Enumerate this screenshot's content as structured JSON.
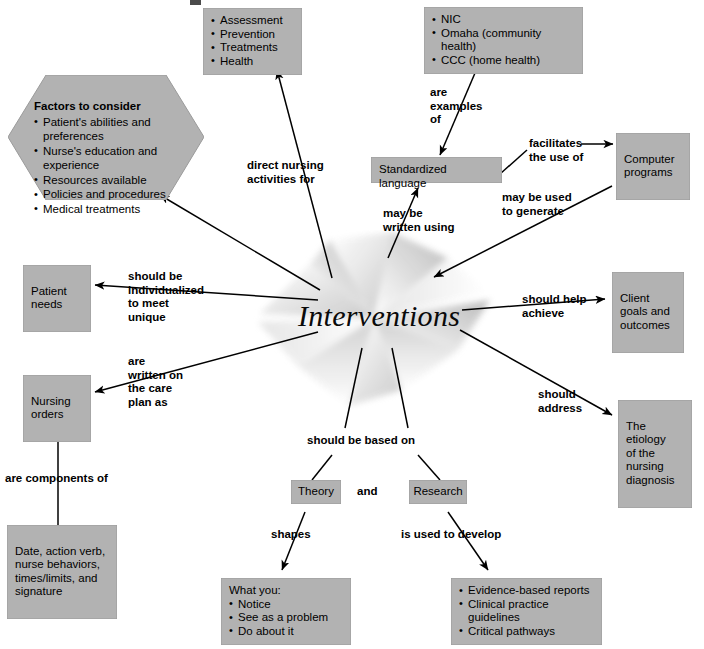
{
  "center": {
    "label": "Interventions"
  },
  "colors": {
    "node_fill": "#b2b2b2",
    "node_edge": "#9a9a9a",
    "text": "#000000",
    "line": "#000000",
    "background": "#ffffff",
    "starburst": "#d9d9d9"
  },
  "nodes": {
    "nursing_activities": {
      "name": "nursing-activities-node",
      "items": [
        "Assessment",
        "Prevention",
        "Treatments",
        "Health"
      ]
    },
    "language_examples": {
      "name": "language-examples-node",
      "items": [
        "NIC",
        "Omaha (community health)",
        "CCC (home health)"
      ]
    },
    "factors": {
      "name": "factors-to-consider-node",
      "heading": "Factors to consider",
      "items": [
        "Patient's abilities and preferences",
        "Nurse's education and experience",
        "Resources available",
        "Policies and procedures",
        "Medical treatments"
      ]
    },
    "standardized_language": {
      "name": "standardized-language-node",
      "text": "Standardized language"
    },
    "computer_programs": {
      "name": "computer-programs-node",
      "text": "Computer\nprograms"
    },
    "patient_needs": {
      "name": "patient-needs-node",
      "text": "Patient\nneeds"
    },
    "client_goals": {
      "name": "client-goals-node",
      "text": "Client\ngoals and\noutcomes"
    },
    "nursing_orders": {
      "name": "nursing-orders-node",
      "text": "Nursing\norders"
    },
    "etiology": {
      "name": "etiology-node",
      "text": "The etiology\nof the\nnursing\ndiagnosis"
    },
    "order_components": {
      "name": "order-components-node",
      "text": "Date, action verb,\nnurse behaviors,\ntimes/limits, and\nsignature"
    },
    "theory": {
      "name": "theory-node",
      "text": "Theory"
    },
    "research": {
      "name": "research-node",
      "text": "Research"
    },
    "what_you": {
      "name": "what-you-node",
      "heading": "What you:",
      "items": [
        "Notice",
        "See as a problem",
        "Do about it"
      ]
    },
    "research_outputs": {
      "name": "research-outputs-node",
      "items": [
        "Evidence-based reports",
        "Clinical practice guidelines",
        "Critical pathways"
      ]
    }
  },
  "edge_labels": {
    "direct_nursing": "direct nursing\nactivities for",
    "are_examples_of": "are\nexamples\nof",
    "facilitates": "facilitates\nthe use of",
    "may_be_written_using": "may be\nwritten using",
    "may_be_used_to_generate": "may be used\nto generate",
    "individualized": "should be\nindividualized\nto meet\nunique",
    "should_help_achieve": "should help\nachieve",
    "written_on_care_plan": "are\nwritten on\nthe care\nplan as",
    "should_address": "should\naddress",
    "are_components_of": "are components of",
    "should_be_based_on": "should be based on",
    "and": "and",
    "shapes": "shapes",
    "is_used_to_develop": "is used to develop"
  }
}
